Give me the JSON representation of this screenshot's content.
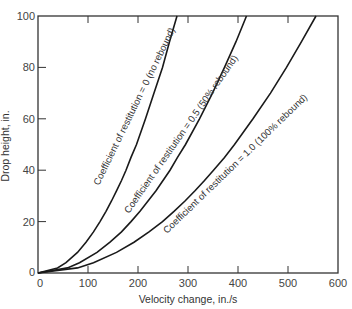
{
  "chart_data": {
    "type": "line",
    "title": "",
    "xlabel": "Velocity change, in./s",
    "ylabel": "Drop height, in.",
    "xlim": [
      0,
      600
    ],
    "ylim": [
      0,
      100
    ],
    "xticks": [
      0,
      100,
      200,
      300,
      400,
      500,
      600
    ],
    "yticks": [
      0,
      20,
      40,
      60,
      80,
      100
    ],
    "grid": false,
    "legend": "inline curve labels",
    "series": [
      {
        "name": "Coefficient of restitution = 0 (no rebound)",
        "x": [
          0,
          39,
          56,
          79,
          96,
          111,
          124,
          136,
          147,
          157,
          167,
          176,
          186,
          197,
          215,
          232,
          249,
          263,
          278
        ],
        "y": [
          0,
          2,
          4,
          8,
          12,
          16,
          20,
          24,
          28,
          32,
          36,
          40,
          45,
          50,
          60,
          70,
          80,
          90,
          100
        ]
      },
      {
        "name": "Coefficient of restitution = 0.5 (50% rebound)",
        "x": [
          0,
          59,
          83,
          118,
          144,
          167,
          186,
          204,
          220,
          236,
          250,
          264,
          279,
          295,
          323,
          349,
          373,
          396,
          417
        ],
        "y": [
          0,
          2,
          4,
          8,
          12,
          16,
          20,
          24,
          28,
          32,
          36,
          40,
          45,
          50,
          60,
          70,
          80,
          90,
          100
        ]
      },
      {
        "name": "Coefficient of restitution = 1.0 (100% rebound)",
        "x": [
          0,
          79,
          111,
          157,
          192,
          222,
          249,
          272,
          294,
          314,
          333,
          351,
          373,
          393,
          430,
          465,
          497,
          527,
          556
        ],
        "y": [
          0,
          2,
          4,
          8,
          12,
          16,
          20,
          24,
          28,
          32,
          36,
          40,
          45,
          50,
          60,
          70,
          80,
          90,
          100
        ]
      }
    ]
  },
  "labels": {
    "xlabel": "Velocity change, in./s",
    "ylabel": "Drop height, in.",
    "xticks": [
      "0",
      "100",
      "200",
      "300",
      "400",
      "500",
      "600"
    ],
    "yticks": [
      "0",
      "20",
      "40",
      "60",
      "80",
      "100"
    ],
    "curve0": "Coefficient of restitution = 0 (no rebound)",
    "curve1": "Coefficient of restitution = 0.5 (50% rebound)",
    "curve2": "Coefficient of restitution = 1.0 (100% rebound)"
  },
  "style": {
    "line_color": "#1a1a1a",
    "axis_color": "#333333"
  }
}
